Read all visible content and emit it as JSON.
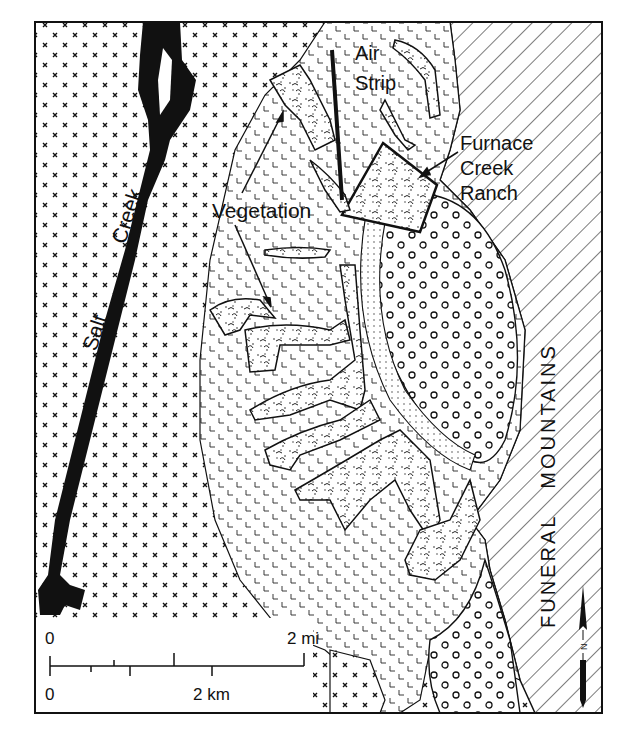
{
  "map": {
    "labels": {
      "salt_creek_1": "Salt",
      "salt_creek_2": "Creek",
      "air_strip_1": "Air",
      "air_strip_2": "Strip",
      "vegetation": "Vegetation",
      "furnace_1": "Furnace",
      "furnace_2": "Creek",
      "furnace_3": "Ranch",
      "mountains": "FUNERAL   MOUNTAINS"
    },
    "scale_bar": {
      "mi_start": "0",
      "mi_end": "2 mi",
      "km_start": "0",
      "km_end": "2 km"
    },
    "north_arrow": {
      "label": "N"
    },
    "colors": {
      "ink": "#111111",
      "paper": "#ffffff"
    }
  }
}
